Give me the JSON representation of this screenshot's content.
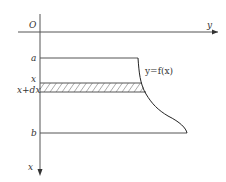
{
  "diagram": {
    "origin_label": "O",
    "y_axis_label": "y",
    "x_axis_label": "x",
    "level_labels": {
      "a": "a",
      "x": "x",
      "x_dx": "x+dx",
      "b": "b"
    },
    "curve_label": "y=f(x)",
    "colors": {
      "line": "#555555",
      "text": "#333333",
      "background": "#ffffff"
    }
  }
}
